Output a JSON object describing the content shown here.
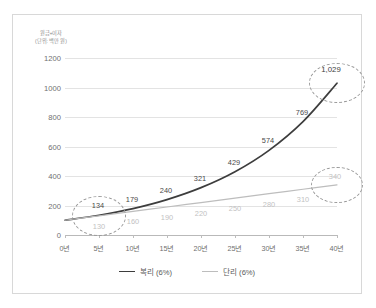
{
  "caption": {
    "line1": "원금+이자",
    "line2": "(단위: 백만 원)"
  },
  "legend": [
    {
      "label": "복리 (6%)",
      "color": "#3d3d3d"
    },
    {
      "label": "단리 (6%)",
      "color": "#bdbdbd"
    }
  ],
  "chart_data": {
    "type": "line",
    "title": "",
    "xlabel": "",
    "ylabel": "원금+이자 (단위: 백만 원)",
    "categories": [
      "0년",
      "5년",
      "10년",
      "15년",
      "20년",
      "25년",
      "30년",
      "35년",
      "40년"
    ],
    "x": [
      0,
      5,
      10,
      15,
      20,
      25,
      30,
      35,
      40
    ],
    "ylim": [
      0,
      1200
    ],
    "yticks": [
      0,
      200,
      400,
      600,
      800,
      1000,
      1200
    ],
    "ytick_labels": [
      "0",
      "200",
      "400",
      "600",
      "800",
      "1000",
      "1200"
    ],
    "grid": true,
    "legend_position": "bottom",
    "series": [
      {
        "name": "복리 (6%)",
        "color": "#3d3d3d",
        "values": [
          100,
          134,
          179,
          240,
          321,
          429,
          574,
          769,
          1029
        ],
        "labels": [
          "",
          "134",
          "179",
          "240",
          "321",
          "429",
          "574",
          "769",
          "1,029"
        ]
      },
      {
        "name": "단리 (6%)",
        "color": "#bdbdbd",
        "values": [
          100,
          130,
          160,
          190,
          220,
          250,
          280,
          310,
          340
        ],
        "labels": [
          "",
          "130",
          "160",
          "190",
          "220",
          "250",
          "280",
          "310",
          "340"
        ]
      }
    ],
    "annotations": [
      {
        "name": "highlight-year-5",
        "x": 5,
        "y": 132,
        "rx": 26,
        "ry": 19
      },
      {
        "name": "highlight-compound-final",
        "x": 40,
        "y": 1029,
        "rx": 27,
        "ry": 19
      },
      {
        "name": "highlight-simple-final",
        "x": 40,
        "y": 340,
        "rx": 25,
        "ry": 17
      }
    ]
  }
}
